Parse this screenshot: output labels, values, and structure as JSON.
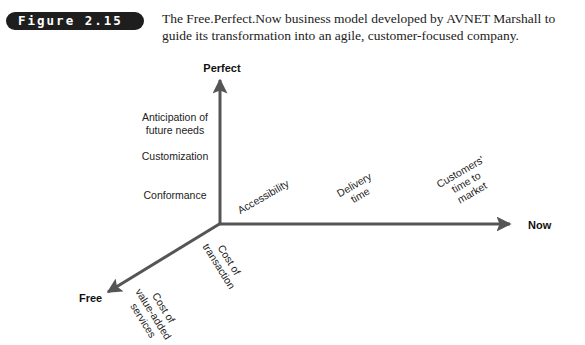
{
  "figure": {
    "label": "Figure 2.15",
    "caption": "The Free.Perfect.Now business model developed by AVNET Marshall to guide its transformation into an agile, customer-focused company."
  },
  "diagram": {
    "axis_color": "#555555",
    "axes": {
      "perfect": "Perfect",
      "now": "Now",
      "free": "Free"
    },
    "perfect_items": {
      "anticipation_line1": "Anticipation of",
      "anticipation_line2": "future needs",
      "customization": "Customization",
      "conformance": "Conformance"
    },
    "now_items": {
      "accessibility": "Accessibility",
      "delivery_line1": "Delivery",
      "delivery_line2": "time",
      "customers_line1": "Customers'",
      "customers_line2": "time to",
      "customers_line3": "market"
    },
    "free_items": {
      "transaction_line1": "Cost of",
      "transaction_line2": "transaction",
      "valueadded_line1": "Cost of",
      "valueadded_line2": "value-added",
      "valueadded_line3": "services"
    }
  }
}
